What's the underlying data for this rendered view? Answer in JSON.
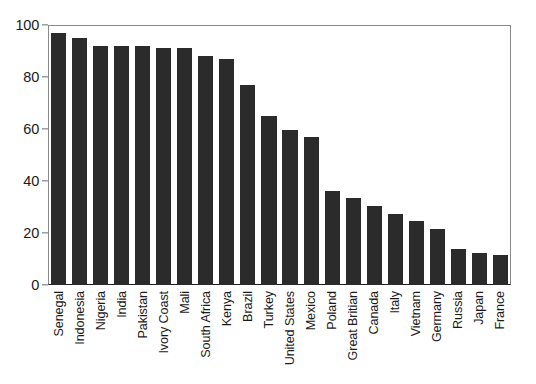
{
  "chart_data": {
    "type": "bar",
    "title": "",
    "subtitle": "",
    "xlabel": "",
    "ylabel": "",
    "ylim": [
      0,
      100
    ],
    "yticks": [
      0,
      20,
      40,
      60,
      80,
      100
    ],
    "grid": false,
    "legend": false,
    "legend_position": "none",
    "bar_color": "#2b2b2b",
    "axis_color": "#1e1e1e",
    "background_color": "#ffffff",
    "orientation": "vertical",
    "categories": [
      "Senegal",
      "Indonesia",
      "Nigeria",
      "India",
      "Pakistan",
      "Ivory Coast",
      "Mali",
      "South Africa",
      "Kenya",
      "Brazil",
      "Turkey",
      "United States",
      "Mexico",
      "Poland",
      "Great Britian",
      "Canada",
      "Italy",
      "Vietnam",
      "Germany",
      "Russia",
      "Japan",
      "France"
    ],
    "values": [
      97,
      95,
      92,
      92,
      92,
      91,
      91,
      88,
      87,
      77,
      65,
      59.5,
      57,
      36,
      33.5,
      30.5,
      27.5,
      24.5,
      21.5,
      14,
      12.5,
      11.5
    ]
  }
}
